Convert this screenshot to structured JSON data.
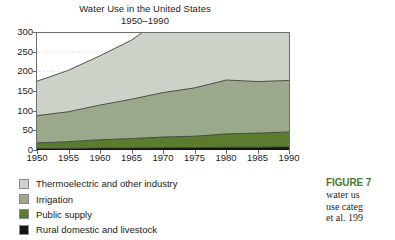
{
  "chart_data": {
    "type": "area",
    "title": "Water Use in the United States",
    "subtitle": "1950–1990",
    "xlabel": "",
    "ylabel": "",
    "stacked": true,
    "grid": true,
    "grid_style": "dotted-horizontal",
    "legend_position": "below-left",
    "xlim": [
      1950,
      1990
    ],
    "ylim": [
      0,
      300
    ],
    "yticks": [
      0,
      50,
      100,
      150,
      200,
      250,
      300
    ],
    "xticks": [
      1950,
      1955,
      1960,
      1965,
      1970,
      1975,
      1980,
      1985,
      1990
    ],
    "x": [
      1950,
      1955,
      1960,
      1965,
      1970,
      1975,
      1980,
      1985,
      1990
    ],
    "series": [
      {
        "name": "Rural domestic and livestock",
        "color": "#141414",
        "values": [
          4,
          4,
          5,
          5,
          6,
          6,
          7,
          7,
          8
        ]
      },
      {
        "name": "Public supply",
        "color": "#5b7b2e",
        "values": [
          14,
          17,
          21,
          24,
          27,
          29,
          34,
          36,
          38
        ]
      },
      {
        "name": "Irrigation",
        "color": "#9aa98b",
        "values": [
          69,
          76,
          88,
          100,
          113,
          123,
          137,
          131,
          131
        ]
      },
      {
        "name": "Thermoelectric and other industry",
        "color": "#cdd2c9",
        "values": [
          87,
          105,
          125,
          150,
          190,
          222,
          252,
          230,
          215
        ]
      }
    ],
    "totals": [
      87,
      105,
      125,
      150,
      190,
      222,
      252,
      230,
      215
    ]
  },
  "title": {
    "line1": "Water Use in the United States",
    "line2": "1950–1990"
  },
  "axes": {
    "y_labels": [
      "300",
      "250",
      "200",
      "150",
      "100",
      "50",
      "0"
    ],
    "x_labels": [
      "1950",
      "1955",
      "1960",
      "1965",
      "1970",
      "1975",
      "1980",
      "1985",
      "1990"
    ]
  },
  "legend": {
    "items": [
      {
        "label": "Thermoelectric and other industry",
        "color": "#cdd2c9"
      },
      {
        "label": "Irrigation",
        "color": "#9aa98b"
      },
      {
        "label": "Public supply",
        "color": "#5b7b2e"
      },
      {
        "label": "Rural domestic and livestock",
        "color": "#141414"
      }
    ]
  },
  "caption": {
    "heading": "FIGURE 7",
    "line1": "water us",
    "line2": "use categ",
    "line3": "et al. 199"
  },
  "colors": {
    "thermoelectric": "#cdd2c9",
    "irrigation": "#9aa98b",
    "public_supply": "#5b7b2e",
    "rural": "#141414",
    "axis": "#6e6e6e",
    "caption_accent": "#4a7a33"
  }
}
